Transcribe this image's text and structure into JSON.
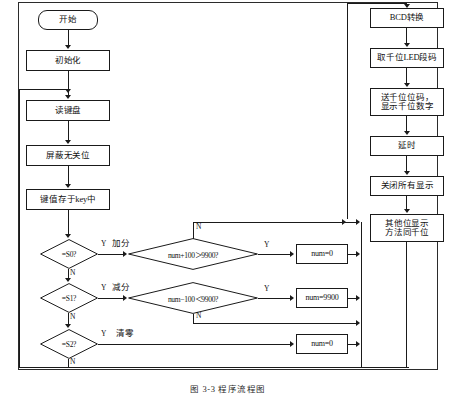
{
  "figure": {
    "caption": "图 3-3   程序流程图",
    "frame_color": "#2b2b2b",
    "line_color": "#1a1a1a",
    "background": "#ffffff"
  },
  "left_column": {
    "nodes": [
      {
        "id": "start",
        "shape": "terminator",
        "label": "开始"
      },
      {
        "id": "init",
        "shape": "process",
        "label": "初始化"
      },
      {
        "id": "readkey",
        "shape": "process",
        "label": "读键盘"
      },
      {
        "id": "mask",
        "shape": "process",
        "label": "屏蔽无关位"
      },
      {
        "id": "storekey",
        "shape": "process",
        "label": "键值存于key中"
      }
    ]
  },
  "decisions": [
    {
      "id": "d_s0",
      "label": "=S0?",
      "yes": "Y",
      "no": "N",
      "branch_label": "加分"
    },
    {
      "id": "d_s1",
      "label": "=S1?",
      "yes": "Y",
      "no": "N",
      "branch_label": "减分"
    },
    {
      "id": "d_s2",
      "label": "=S2?",
      "yes": "Y",
      "no": "N",
      "branch_label": "清零"
    }
  ],
  "conditions": [
    {
      "id": "c_add",
      "label": "num+100＞9900?",
      "yes": "Y",
      "no": "N"
    },
    {
      "id": "c_sub",
      "label": "num−100＜9900?",
      "yes": "Y",
      "no": "N"
    }
  ],
  "result_boxes": [
    {
      "id": "r_add",
      "label": "num=0"
    },
    {
      "id": "r_sub",
      "label": "num=9900"
    },
    {
      "id": "r_clear",
      "label": "num=0"
    }
  ],
  "right_column": {
    "nodes": [
      {
        "id": "bcd",
        "label": "BCD转换"
      },
      {
        "id": "seg",
        "label": "取千位LED段码"
      },
      {
        "id": "showk",
        "label": "送千位位码，\n显示千位数字"
      },
      {
        "id": "delay",
        "label": "延时"
      },
      {
        "id": "offall",
        "label": "关闭所有显示"
      },
      {
        "id": "others",
        "label": "其他位显示\n方法同千位"
      }
    ]
  }
}
